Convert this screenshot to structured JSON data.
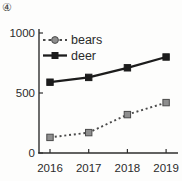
{
  "figure": {
    "label": "④"
  },
  "chart_data": {
    "type": "line",
    "title": "",
    "xlabel": "",
    "ylabel": "",
    "categories": [
      "2016",
      "2017",
      "2018",
      "2019"
    ],
    "series": [
      {
        "name": "bears",
        "label": "bears",
        "values": [
          130,
          170,
          320,
          420
        ],
        "line_style": "dotted",
        "line_color": "#4a4a4a",
        "marker": "square",
        "marker_fill": "#8e8e8e",
        "marker_stroke": "#4a4a4a",
        "legend_marker": "circle"
      },
      {
        "name": "deer",
        "label": "deer",
        "values": [
          590,
          630,
          710,
          800
        ],
        "line_style": "solid",
        "line_color": "#1c1c1c",
        "marker": "square",
        "marker_fill": "#1c1c1c",
        "marker_stroke": "#1c1c1c",
        "legend_marker": "square"
      }
    ],
    "ylim": [
      0,
      1000
    ],
    "yticks": [
      0,
      500,
      1000
    ],
    "grid": false,
    "legend_position": "upper-left",
    "axis_color": "#2e2e2e",
    "text_color": "#2b2b2b"
  }
}
